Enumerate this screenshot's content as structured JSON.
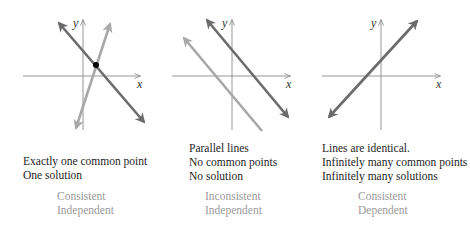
{
  "colors": {
    "axis": "#8a8a8a",
    "primary_line": "#6b6b6b",
    "secondary_line": "#a8a8a8",
    "point": "#000000",
    "text": "#1e1e1e",
    "classification_text": "#9a9a9a"
  },
  "panels": [
    {
      "axis_labels": {
        "x": "x",
        "y": "y"
      },
      "description": [
        "Exactly one common point",
        "One solution"
      ],
      "classification": [
        "Consistent",
        "Independent"
      ]
    },
    {
      "axis_labels": {
        "x": "x",
        "y": "y"
      },
      "description": [
        "Parallel lines",
        "No common points",
        "No solution"
      ],
      "classification": [
        "Inconsistent",
        "Independent"
      ]
    },
    {
      "axis_labels": {
        "x": "x",
        "y": "y"
      },
      "description": [
        "Lines are identical.",
        "Infinitely many common points",
        "Infinitely many solutions"
      ],
      "classification": [
        "Consistent",
        "Dependent"
      ]
    }
  ]
}
